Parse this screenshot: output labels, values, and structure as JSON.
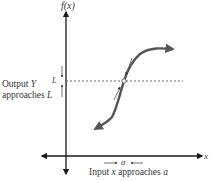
{
  "figure": {
    "y_axis_label": "f(x)",
    "x_axis_label": "x",
    "limit_label": "L",
    "output_label_line1": "Output Y",
    "output_label_line2": "approaches L",
    "a_label": "a",
    "input_label": "Input x approaches a"
  },
  "colors": {
    "axis": "#1a1a1a",
    "curve": "#555555",
    "dotted": "#666666",
    "text": "#333333"
  }
}
